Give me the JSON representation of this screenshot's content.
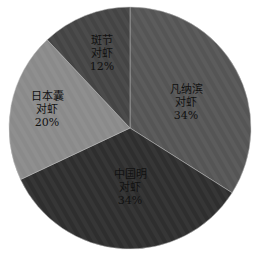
{
  "chart_data": {
    "type": "pie",
    "title": "",
    "start_angle_deg": 0,
    "direction": "clockwise",
    "center": [
      130,
      128
    ],
    "radius": 121,
    "slices": [
      {
        "label_lines": [
          "凡纳滨",
          "对虾"
        ],
        "label": "凡纳滨对虾",
        "value": 34,
        "pct_text": "34%",
        "color": "#555555",
        "label_pos": [
          186,
          93
        ]
      },
      {
        "label_lines": [
          "中国明",
          "对虾"
        ],
        "label": "中国明对虾",
        "value": 34,
        "pct_text": "34%",
        "color": "#2e2e2e",
        "label_pos": [
          130,
          178
        ]
      },
      {
        "label_lines": [
          "日本囊",
          "对虾"
        ],
        "label": "日本囊对虾",
        "value": 20,
        "pct_text": "20%",
        "color": "#8a8a8a",
        "label_pos": [
          47,
          100
        ]
      },
      {
        "label_lines": [
          "斑节",
          "对虾"
        ],
        "label": "斑节对虾",
        "value": 12,
        "pct_text": "12%",
        "color": "#444444",
        "label_pos": [
          102,
          44
        ]
      }
    ]
  }
}
